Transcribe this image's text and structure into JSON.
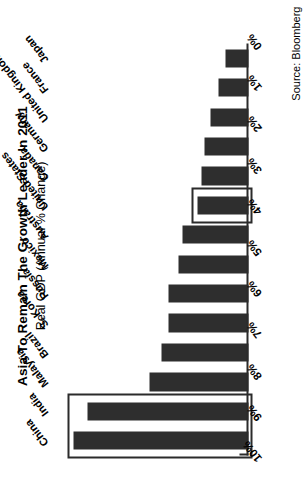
{
  "chart_data": {
    "type": "bar",
    "orientation": "horizontal-rotated",
    "title": "Asia To Remain The Growth Leader In 2011",
    "subtitle": "Real GDP (Annual % Change)",
    "source": "Source: Bloomberg",
    "xlabel": "",
    "ylabel": "",
    "ylim": [
      0,
      10
    ],
    "grid": false,
    "legend": "none",
    "tick_labels": [
      "0%",
      "1%",
      "2%",
      "3%",
      "4%",
      "5%",
      "6%",
      "7%",
      "8%",
      "9%",
      "10%"
    ],
    "tick_values": [
      0,
      1,
      2,
      3,
      4,
      5,
      6,
      7,
      8,
      9,
      10
    ],
    "categories": [
      "China",
      "India",
      "Malaysia",
      "Brazil",
      "S. Korea",
      "Russia",
      "Mexico",
      "Australia",
      "United States",
      "Canada",
      "Germany",
      "United Kingdom",
      "France",
      "Japan"
    ],
    "values": [
      9.2,
      8.5,
      5.2,
      4.6,
      4.2,
      4.2,
      3.7,
      3.5,
      2.7,
      2.5,
      2.3,
      2.0,
      1.6,
      1.2
    ],
    "highlighted": [
      "China",
      "India",
      "United States"
    ],
    "bar_color": "#2e2e2e",
    "highlight_color": "#2b2b2b",
    "background": "#ffffff"
  }
}
